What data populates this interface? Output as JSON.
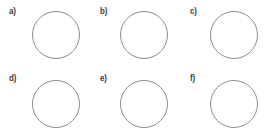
{
  "figure": {
    "background_color": "#ffffff",
    "stroke_color": "#8c8c8c",
    "label_color": "#3a3a3a",
    "columns": 3,
    "rows": 2,
    "panel_count": 6
  },
  "panels": [
    {
      "label": "a)",
      "label_x": 9,
      "label_y": 7,
      "circle_x": 32,
      "circle_y": 11,
      "circle_diameter": 48
    },
    {
      "label": "b)",
      "label_x": 100,
      "label_y": 7,
      "circle_x": 120,
      "circle_y": 11,
      "circle_diameter": 48
    },
    {
      "label": "c)",
      "label_x": 190,
      "label_y": 7,
      "circle_x": 210,
      "circle_y": 11,
      "circle_diameter": 48
    },
    {
      "label": "d)",
      "label_x": 9,
      "label_y": 74,
      "circle_x": 32,
      "circle_y": 80,
      "circle_diameter": 48
    },
    {
      "label": "e)",
      "label_x": 100,
      "label_y": 74,
      "circle_x": 120,
      "circle_y": 80,
      "circle_diameter": 48
    },
    {
      "label": "f)",
      "label_x": 190,
      "label_y": 74,
      "circle_x": 210,
      "circle_y": 80,
      "circle_diameter": 48
    }
  ]
}
